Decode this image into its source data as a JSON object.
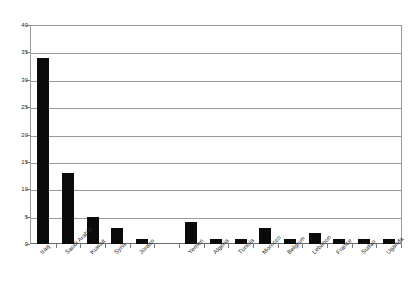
{
  "chart_data": {
    "type": "bar",
    "title": "",
    "subtitle": "",
    "xlabel": "",
    "ylabel": "",
    "ylim": [
      0,
      40
    ],
    "ytick_step": 5,
    "yticks": [
      "0",
      "5",
      "10",
      "15",
      "20",
      "25",
      "30",
      "35",
      "40"
    ],
    "grid": true,
    "legend": false,
    "legend_position": "none",
    "bar_color": "#0b0b0b",
    "categories": [
      "Iraq",
      "Saudi Arabia",
      "Kuwait",
      "Syria",
      "Jordan",
      "",
      "Yemen",
      "Algeria",
      "Tunisia",
      "Morocco",
      "Belgium",
      "Lebanon",
      "France",
      "Sudan",
      "Uganda"
    ],
    "values": [
      34,
      13,
      5,
      3,
      1,
      0,
      4,
      1,
      1,
      3,
      1,
      2,
      1,
      1,
      1
    ]
  },
  "colors": {
    "bar": "#0b0b0b",
    "gridline": "#9a9a9a",
    "axis": "#6a6a6a",
    "text": "#2b2b2b",
    "background": "#ffffff"
  }
}
